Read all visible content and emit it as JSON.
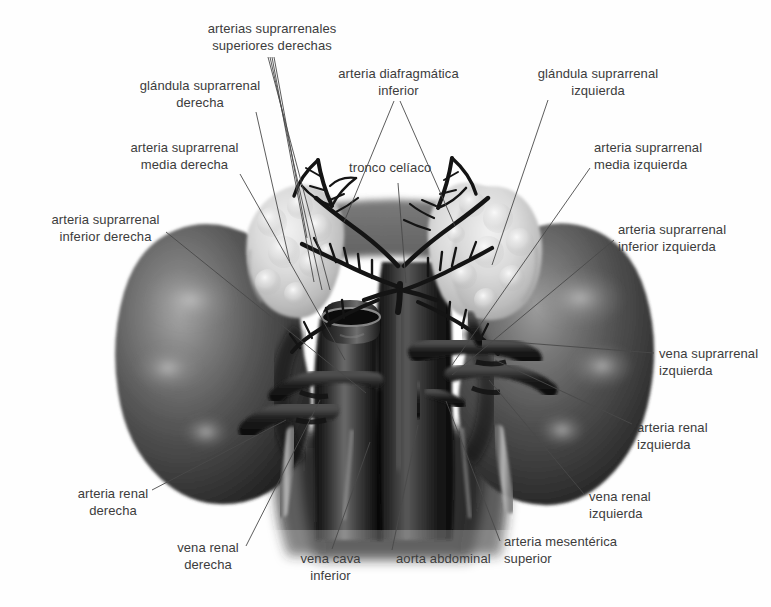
{
  "figure": {
    "language": "es",
    "background_color": "#fefefe",
    "label_color": "#3c3c3c",
    "leader_line_color": "#4a4a4a",
    "palette": {
      "kidney_dark": "#2f2f2f",
      "kidney_mid": "#5d5d5d",
      "kidney_light": "#8e8e8e",
      "kidney_highlight": "#b5b5b5",
      "adrenal_light": "#e2e2e2",
      "adrenal_mid": "#c9c9c9",
      "adrenal_shadow": "#a6a6a6",
      "vessel_dark": "#1a1a1a",
      "vessel_mid": "#3a3a3a",
      "aorta_dark": "#161616",
      "cava_dark": "#242424"
    },
    "structures": [
      {
        "name": "glandula-suprarrenal-derecha",
        "kind": "adrenal-gland",
        "side": "right"
      },
      {
        "name": "glandula-suprarrenal-izquierda",
        "kind": "adrenal-gland",
        "side": "left"
      },
      {
        "name": "rinon-derecho",
        "kind": "kidney",
        "side": "right"
      },
      {
        "name": "rinon-izquierdo",
        "kind": "kidney",
        "side": "left"
      },
      {
        "name": "aorta-abdominal",
        "kind": "artery"
      },
      {
        "name": "vena-cava-inferior",
        "kind": "vein"
      },
      {
        "name": "diafragma",
        "kind": "muscle"
      }
    ]
  },
  "labels": [
    {
      "id": "arterias-suprarrenales-superiores-derechas",
      "lines": [
        "arterias suprarrenales",
        "superiores derechas"
      ],
      "align": "center",
      "x": 196,
      "y": 21,
      "w": 152
    },
    {
      "id": "glandula-suprarrenal-derecha",
      "lines": [
        "glándula suprarrenal",
        "derecha"
      ],
      "align": "center",
      "x": 130,
      "y": 78,
      "w": 140
    },
    {
      "id": "arteria-diafragmatica-inferior",
      "lines": [
        "arteria diafragmática",
        "inferior"
      ],
      "align": "center",
      "x": 326,
      "y": 66,
      "w": 145
    },
    {
      "id": "glandula-suprarrenal-izquierda",
      "lines": [
        "glándula suprarrenal",
        "izquierda"
      ],
      "align": "center",
      "x": 528,
      "y": 66,
      "w": 140
    },
    {
      "id": "arteria-suprarrenal-media-derecha",
      "lines": [
        "arteria suprarrenal",
        "media derecha"
      ],
      "align": "center",
      "x": 118,
      "y": 140,
      "w": 133
    },
    {
      "id": "tronco-celiaco",
      "lines": [
        "tronco celíaco"
      ],
      "align": "left",
      "x": 349,
      "y": 160,
      "w": 100
    },
    {
      "id": "arteria-suprarrenal-media-izquierda",
      "lines": [
        "arteria suprarrenal",
        "media izquierda"
      ],
      "align": "left",
      "x": 594,
      "y": 140,
      "w": 140
    },
    {
      "id": "arteria-suprarrenal-inferior-derecha",
      "lines": [
        "arteria suprarrenal",
        "inferior derecha"
      ],
      "align": "center",
      "x": 38,
      "y": 212,
      "w": 135
    },
    {
      "id": "arteria-suprarrenal-inferior-izquierda",
      "lines": [
        "arteria suprarrenal",
        "inferior izquierda"
      ],
      "align": "left",
      "x": 618,
      "y": 222,
      "w": 145
    },
    {
      "id": "vena-suprarrenal-izquierda",
      "lines": [
        "vena suprarrenal",
        "izquierda"
      ],
      "align": "left",
      "x": 659,
      "y": 346,
      "w": 112
    },
    {
      "id": "arteria-renal-izquierda",
      "lines": [
        "arteria renal",
        "izquierda"
      ],
      "align": "left",
      "x": 637,
      "y": 420,
      "w": 100
    },
    {
      "id": "arteria-renal-derecha",
      "lines": [
        "arteria renal",
        "derecha"
      ],
      "align": "center",
      "x": 64,
      "y": 486,
      "w": 98
    },
    {
      "id": "vena-renal-izquierda",
      "lines": [
        "vena renal",
        "izquierda"
      ],
      "align": "left",
      "x": 589,
      "y": 489,
      "w": 96
    },
    {
      "id": "vena-renal-derecha",
      "lines": [
        "vena renal",
        "derecha"
      ],
      "align": "center",
      "x": 160,
      "y": 540,
      "w": 96
    },
    {
      "id": "vena-cava-inferior",
      "lines": [
        "vena cava",
        "inferior"
      ],
      "align": "center",
      "x": 288,
      "y": 551,
      "w": 85
    },
    {
      "id": "aorta-abdominal",
      "lines": [
        "aorta abdominal"
      ],
      "align": "left",
      "x": 396,
      "y": 551,
      "w": 120
    },
    {
      "id": "arteria-mesenterica-superior",
      "lines": [
        "arteria mesentérica",
        "superior"
      ],
      "align": "left",
      "x": 504,
      "y": 534,
      "w": 135
    }
  ],
  "leader_lines": [
    {
      "id": "leader-arterias-suprarrenales-superiores-derechas-a",
      "points": "268,57 330,290"
    },
    {
      "id": "leader-arterias-suprarrenales-superiores-derechas-b",
      "points": "270,57 322,290"
    },
    {
      "id": "leader-arterias-suprarrenales-superiores-derechas-c",
      "points": "272,57 314,282"
    },
    {
      "id": "leader-arterias-suprarrenales-superiores-derechas-d",
      "points": "274,57 307,238"
    },
    {
      "id": "leader-glandula-suprarrenal-derecha",
      "points": "256,112 290,263"
    },
    {
      "id": "leader-arteria-diafragmatica-inferior-left",
      "points": "394,101 344,222"
    },
    {
      "id": "leader-arteria-diafragmatica-inferior-right",
      "points": "400,101 455,226"
    },
    {
      "id": "leader-glandula-suprarrenal-izquierda",
      "points": "548,100 492,265"
    },
    {
      "id": "leader-arteria-suprarrenal-media-derecha",
      "points": "240,174 345,360"
    },
    {
      "id": "leader-tronco-celiaco",
      "points": "398,183 406,283"
    },
    {
      "id": "leader-arteria-suprarrenal-media-izquierda",
      "points": "590,168 452,365"
    },
    {
      "id": "leader-arteria-suprarrenal-inferior-derecha",
      "points": "166,232 366,393"
    },
    {
      "id": "leader-arteria-suprarrenal-inferior-izquierda",
      "points": "614,240 452,375"
    },
    {
      "id": "leader-vena-suprarrenal-izquierda",
      "points": "654,353 486,340"
    },
    {
      "id": "leader-arteria-renal-izquierda",
      "points": "632,424 495,360"
    },
    {
      "id": "leader-arteria-renal-derecha",
      "points": "152,490 286,420"
    },
    {
      "id": "leader-vena-renal-izquierda",
      "points": "584,494 489,380"
    },
    {
      "id": "leader-vena-renal-derecha",
      "points": "246,546 320,400"
    },
    {
      "id": "leader-vena-cava-inferior",
      "points": "332,549 370,442"
    },
    {
      "id": "leader-aorta-abdominal",
      "points": "392,550 418,425"
    },
    {
      "id": "leader-arteria-mesenterica-superior",
      "points": "500,541 446,401"
    }
  ]
}
